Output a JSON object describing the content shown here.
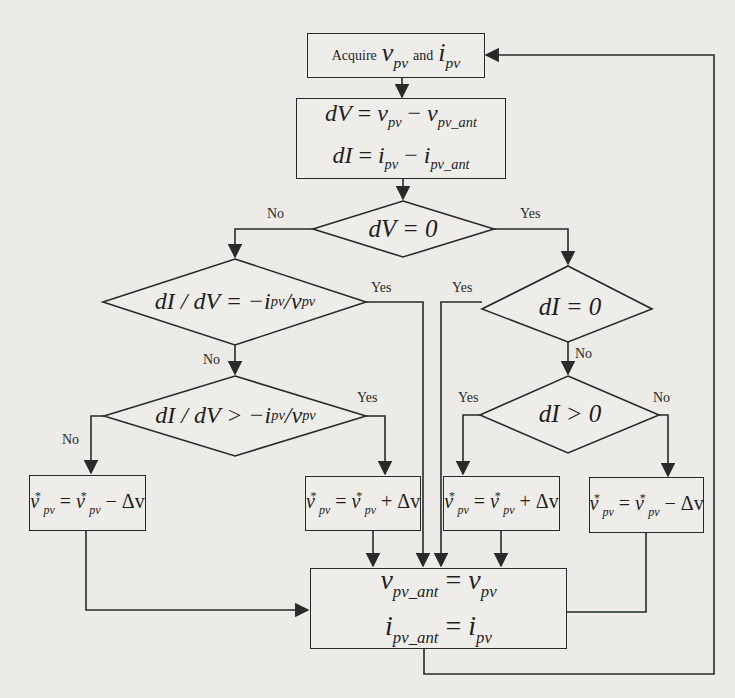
{
  "diagram": {
    "type": "flowchart",
    "nodes": {
      "acquire": {
        "prefix": "Acquire",
        "v": "v",
        "v_sub": "pv",
        "and": "and",
        "i": "i",
        "i_sub": "pv"
      },
      "calc": {
        "line1": {
          "lhs": "dV",
          "eq": " = ",
          "a": "v",
          "a_sub": "pv",
          "op": " − ",
          "b": "v",
          "b_sub": "pv_ant"
        },
        "line2": {
          "lhs": "dI",
          "eq": " = ",
          "a": "i",
          "a_sub": "pv",
          "op": " − ",
          "b": "i",
          "b_sub": "pv_ant"
        }
      },
      "dv_zero": {
        "text": "dV = 0"
      },
      "didv_eq": {
        "lhs": "dI / dV = −",
        "i": "i",
        "i_sub": "pv",
        "slash": " / ",
        "v": "v",
        "v_sub": "pv"
      },
      "di_zero": {
        "text": "dI = 0"
      },
      "didv_gt": {
        "lhs": "dI / dV > −",
        "i": "i",
        "i_sub": "pv",
        "slash": " / ",
        "v": "v",
        "v_sub": "pv"
      },
      "di_gt": {
        "text": "dI > 0"
      },
      "dec_left": {
        "v": "v",
        "sub": "pv",
        "sup": "*",
        "eq": " = ",
        "op": " − Δv"
      },
      "inc_mid": {
        "v": "v",
        "sub": "pv",
        "sup": "*",
        "eq": " = ",
        "op": " + Δv"
      },
      "inc_right": {
        "v": "v",
        "sub": "pv",
        "sup": "*",
        "eq": " = ",
        "op": " + Δv"
      },
      "dec_right": {
        "v": "v",
        "sub": "pv",
        "sup": "*",
        "eq": " = ",
        "op": " − Δv"
      },
      "update": {
        "line1": {
          "a": "v",
          "a_sub": "pv_ant",
          "eq": " = ",
          "b": "v",
          "b_sub": "pv"
        },
        "line2": {
          "a": "i",
          "a_sub": "pv_ant",
          "eq": " = ",
          "b": "i",
          "b_sub": "pv"
        }
      }
    },
    "edge_labels": {
      "dv_no": "No",
      "dv_yes": "Yes",
      "didv_eq_yes": "Yes",
      "didv_eq_no": "No",
      "di_zero_yes": "Yes",
      "di_zero_no": "No",
      "didv_gt_yes": "Yes",
      "didv_gt_no": "No",
      "di_gt_yes": "Yes",
      "di_gt_no": "No"
    },
    "colors": {
      "line": "#2a2a2a",
      "background": "#ecebe8"
    }
  }
}
